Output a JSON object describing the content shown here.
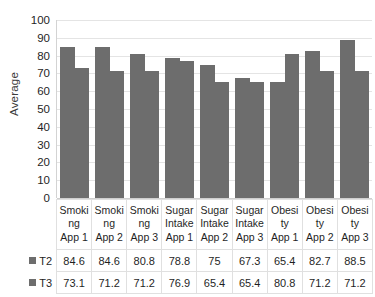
{
  "chart_data": {
    "type": "bar",
    "title": "",
    "xlabel": "",
    "ylabel": "Average",
    "ylim": [
      0,
      100
    ],
    "ytick_step": 10,
    "yticks": [
      100,
      90,
      80,
      70,
      60,
      50,
      40,
      30,
      20,
      10,
      0
    ],
    "grid": true,
    "legend_position": "table-left",
    "categories": [
      "Smoking App 1",
      "Smoking App 2",
      "Smoking App 3",
      "Sugar Intake App 1",
      "Sugar Intake App 2",
      "Sugar Intake App 3",
      "Obesity App 1",
      "Obesity App 2",
      "Obesity App 3"
    ],
    "category_lines": [
      [
        "Smoki",
        "ng",
        "App 1"
      ],
      [
        "Smoki",
        "ng",
        "App 2"
      ],
      [
        "Smoki",
        "ng",
        "App 3"
      ],
      [
        "Sugar",
        "Intake",
        "App 1"
      ],
      [
        "Sugar",
        "Intake",
        "App 2"
      ],
      [
        "Sugar",
        "Intake",
        "App 3"
      ],
      [
        "Obesi",
        "ty",
        "App 1"
      ],
      [
        "Obesi",
        "ty",
        "App 2"
      ],
      [
        "Obesi",
        "ty",
        "App 3"
      ]
    ],
    "series": [
      {
        "name": "T2",
        "color": "#6d6d6d",
        "values": [
          84.6,
          84.6,
          80.8,
          78.8,
          75,
          67.3,
          65.4,
          82.7,
          88.5
        ]
      },
      {
        "name": "T3",
        "color": "#6d6d6d",
        "values": [
          73.1,
          71.2,
          71.2,
          76.9,
          65.4,
          65.4,
          80.8,
          71.2,
          71.2
        ]
      }
    ]
  },
  "colors": {
    "bar": "#6d6d6d",
    "gridline": "#e4e4e4",
    "axis": "#cfcfcf",
    "table_border": "#e0e0e0",
    "text": "#1f1f1f",
    "background": "#ffffff"
  }
}
